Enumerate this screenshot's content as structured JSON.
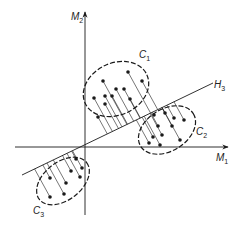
{
  "diagram": {
    "axes": {
      "x_label": "M",
      "x_sub": "1",
      "y_label": "M",
      "y_sub": "2"
    },
    "line": {
      "label": "H",
      "sub": "3"
    },
    "clusters": [
      {
        "label": "C",
        "sub": "1"
      },
      {
        "label": "C",
        "sub": "2"
      },
      {
        "label": "C",
        "sub": "3"
      }
    ]
  },
  "colors": {
    "ink": "#1a1a1a",
    "background": "#ffffff"
  }
}
